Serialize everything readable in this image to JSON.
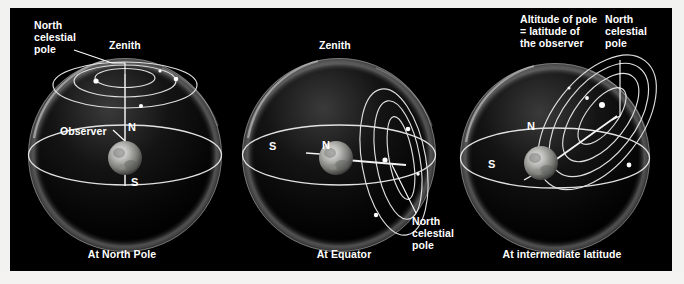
{
  "figure": {
    "background_color": "#000000",
    "page_color": "#f2f2f0",
    "line_color": "#e8e8e8",
    "text_color": "#ffffff",
    "star_color": "#ffffff"
  },
  "panels": [
    {
      "id": "north-pole",
      "caption": "At North Pole",
      "labels": {
        "ncp": "North\ncelestial\npole",
        "zenith": "Zenith",
        "observer": "Observer",
        "north_axis": "N",
        "south_axis": "S"
      },
      "geometry": {
        "axis_tilt_deg": 90,
        "star_circle_count": 3,
        "star_count": 4,
        "horizon": "horizontal ellipse through sphere center"
      }
    },
    {
      "id": "equator",
      "caption": "At Equator",
      "labels": {
        "ncp": "North\ncelestial\npole",
        "zenith": "Zenith",
        "north_axis": "N",
        "south_axis": "S"
      },
      "geometry": {
        "axis_tilt_deg": 0,
        "star_circle_count": 3,
        "star_count": 4,
        "horizon": "horizontal ellipse through sphere center"
      }
    },
    {
      "id": "intermediate",
      "caption": "At intermediate latitude",
      "labels": {
        "altitude": "Altitude of pole\n= latitude of\nthe observer",
        "ncp": "North\ncelestial\npole",
        "north_axis": "N",
        "south_axis": "S"
      },
      "geometry": {
        "axis_tilt_deg": 40,
        "star_circle_count": 4,
        "star_count": 4,
        "horizon": "horizontal ellipse through sphere center"
      }
    }
  ]
}
